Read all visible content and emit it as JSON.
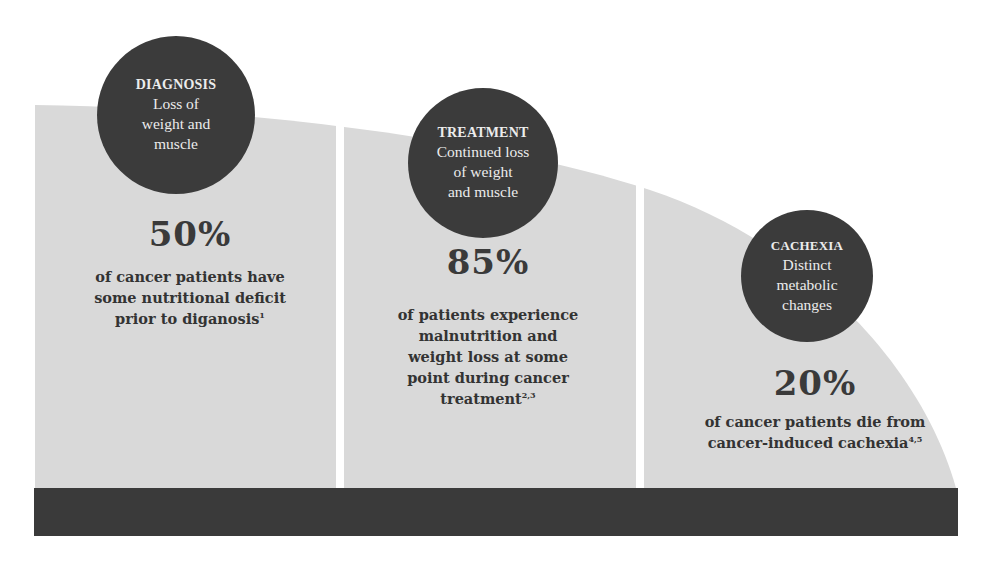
{
  "colors": {
    "panel_fill": "#d9d9d9",
    "circle_fill": "#3b3b3b",
    "bottom_bar": "#3a3a3a",
    "divider": "#ffffff",
    "circle_text": "#ececec",
    "stat_text": "#333333"
  },
  "stages": [
    {
      "title": "DIAGNOSIS",
      "description": [
        "Loss of",
        "weight and",
        "muscle"
      ],
      "stat": "50%",
      "stat_description": [
        "of cancer patients have",
        "some nutritional deficit",
        "prior to diganosis"
      ],
      "footnote": "1"
    },
    {
      "title": "TREATMENT",
      "description": [
        "Continued loss",
        "of weight",
        "and muscle"
      ],
      "stat": "85%",
      "stat_description": [
        "of patients experience",
        "malnutrition and",
        "weight loss at some",
        "point during cancer",
        "treatment"
      ],
      "footnote": "2,3"
    },
    {
      "title": "CACHEXIA",
      "description": [
        "Distinct",
        "metabolic",
        "changes"
      ],
      "stat": "20%",
      "stat_description": [
        "of cancer patients die from",
        "cancer-induced cachexia"
      ],
      "footnote": "4,5"
    }
  ]
}
